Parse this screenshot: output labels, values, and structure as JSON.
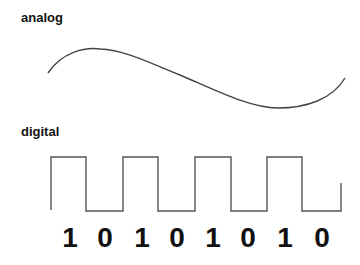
{
  "labels": {
    "analog": "analog",
    "digital": "digital"
  },
  "colors": {
    "stroke": "#444444",
    "text": "#111111"
  },
  "digital": {
    "bits": [
      "1",
      "0",
      "1",
      "0",
      "1",
      "0",
      "1",
      "0"
    ]
  }
}
